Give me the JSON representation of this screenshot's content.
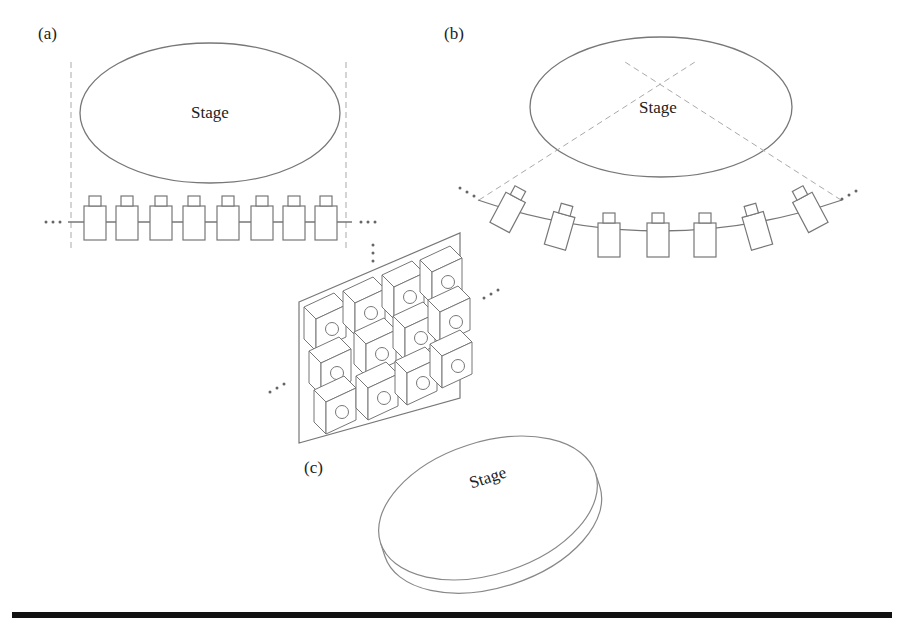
{
  "figure": {
    "panels": [
      {
        "id": "a",
        "label": "(a)",
        "stage_label": "Stage",
        "arrangement": "linear camera array",
        "camera_count": 8
      },
      {
        "id": "b",
        "label": "(b)",
        "stage_label": "Stage",
        "arrangement": "arc (convergent) camera array",
        "camera_count": 7
      },
      {
        "id": "c",
        "label": "(c)",
        "stage_label": "Stage",
        "arrangement": "2D planar camera grid",
        "camera_rows": 3,
        "camera_cols": 4
      }
    ],
    "ellipsis": "...",
    "colors": {
      "line": "#777777",
      "dashed": "#aaaaaa",
      "text": "#222222",
      "rule": "#111111",
      "background": "#ffffff"
    }
  }
}
